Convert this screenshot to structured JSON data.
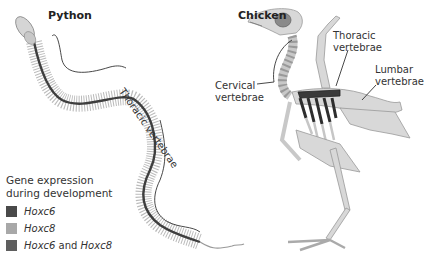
{
  "panels": {
    "python": {
      "title": "Python",
      "label_thoracic": "Thoracic vertebrae"
    },
    "chicken": {
      "title": "Chicken",
      "label_cervical_1": "Cervical",
      "label_cervical_2": "vertebrae",
      "label_thoracic_1": "Thoracic",
      "label_thoracic_2": "vertebrae",
      "label_lumbar_1": "Lumbar",
      "label_lumbar_2": "vertebrae"
    }
  },
  "legend": {
    "title_line1": "Gene expression",
    "title_line2": "during development",
    "items": [
      {
        "gene": "Hoxc6",
        "color": "#4a4a4a"
      },
      {
        "gene": "Hoxc8",
        "color": "#a8a8a8"
      },
      {
        "gene_a": "Hoxc6",
        "joiner": " and ",
        "gene_b": "Hoxc8",
        "color": "#5e5e5e"
      }
    ]
  },
  "colors": {
    "bone": "#d8d8d8",
    "bone_dark": "#b0b0b0",
    "hoxc6": "#4a4a4a",
    "hoxc8": "#a8a8a8",
    "both": "#5e5e5e"
  }
}
